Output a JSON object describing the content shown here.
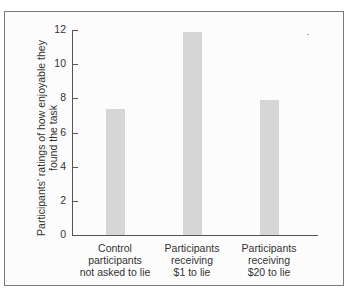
{
  "chart_data": {
    "type": "bar",
    "title": "",
    "xlabel": "",
    "ylabel": "Participants' ratings of how enjoyable they found the task",
    "categories": [
      "Control participants not asked to lie",
      "Participants receiving $1 to lie",
      "Participants receiving $20 to lie"
    ],
    "category_lines": [
      [
        "Control",
        "participants",
        "not asked to lie"
      ],
      [
        "Participants",
        "receiving",
        "$1 to lie"
      ],
      [
        "Participants",
        "receiving",
        "$20 to lie"
      ]
    ],
    "values": [
      7.4,
      11.9,
      7.9
    ],
    "ylim": [
      0,
      12
    ],
    "yticks": [
      "0",
      "2",
      "4",
      "6",
      "8",
      "10",
      "12"
    ],
    "grid": false,
    "legend": null,
    "bar_color": "#d6d6d6"
  },
  "ylabel_lines": [
    "Participants' ratings of how enjoyable they",
    "found the task"
  ]
}
